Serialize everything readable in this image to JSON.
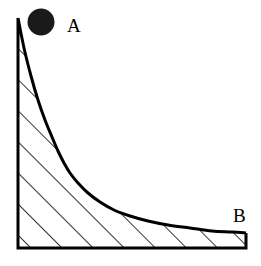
{
  "figure": {
    "background_color": "#ffffff",
    "stroke_color": "#000000",
    "fill_color": "#ffffff",
    "ball_color": "#1a1a1a",
    "width": 261,
    "height": 266
  },
  "labels": {
    "point_a": "A",
    "point_b": "B"
  },
  "chart_data": {
    "type": "line",
    "xlabel": "",
    "ylabel": "",
    "grid": false,
    "legend": "none",
    "xlim": [
      18,
      246
    ],
    "ylim": [
      248,
      18
    ],
    "annotations": [
      {
        "text": "A",
        "x": 41,
        "y": 22,
        "marker": "filled-circle"
      },
      {
        "text": "B",
        "x": 246,
        "y": 233,
        "marker": "none"
      }
    ],
    "series": [
      {
        "name": "ramp-curve",
        "x": [
          18,
          24,
          31,
          38,
          45,
          52,
          58,
          64,
          70,
          78,
          88,
          100,
          114,
          130,
          148,
          168,
          190,
          212,
          232,
          246
        ],
        "y": [
          18,
          48,
          76,
          100,
          120,
          137,
          151,
          163,
          173,
          183,
          193,
          202,
          210,
          216,
          221,
          225,
          228,
          231,
          232,
          233
        ]
      }
    ],
    "region": {
      "name": "hatched-support",
      "hatch_angle_deg": 45,
      "hatch_spacing_px": 22,
      "vertices": [
        {
          "x": 18,
          "y": 18
        },
        {
          "x": 18,
          "y": 248
        },
        {
          "x": 246,
          "y": 248
        },
        {
          "x": 246,
          "y": 233
        }
      ]
    }
  }
}
